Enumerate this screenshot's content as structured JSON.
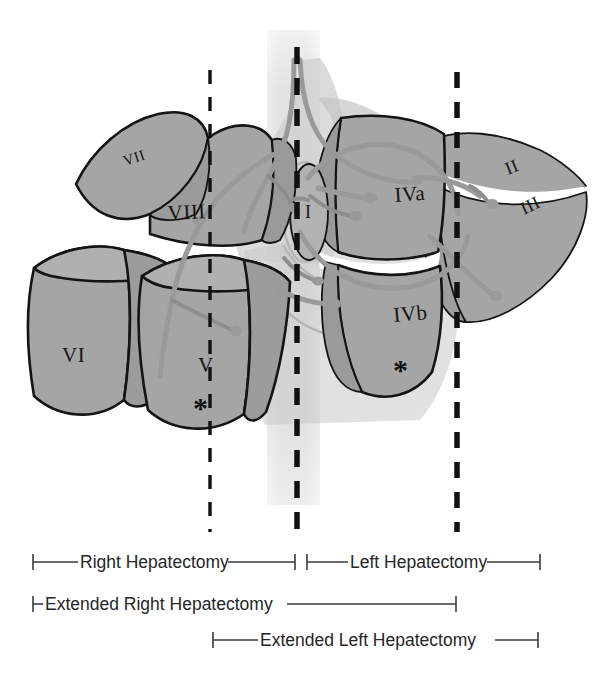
{
  "figure": {
    "background_color": "#ffffff"
  },
  "colors": {
    "segment_fill": "#a5a5a5",
    "segment_fill_light": "#b9b9b9",
    "segment_outline": "#141414",
    "vena_cava": "#e2e2e2",
    "vessel": "#9a9a9a",
    "division_line": "#111111",
    "bracket": "#3a3a3a",
    "label_text": "#151515"
  },
  "segments": [
    {
      "id": "II",
      "label": "II",
      "x": 508,
      "y": 175,
      "size": "md",
      "rotate": -22
    },
    {
      "id": "III",
      "label": "III",
      "x": 524,
      "y": 215,
      "size": "md",
      "rotate": -26
    },
    {
      "id": "IVa",
      "label": "IVa",
      "x": 395,
      "y": 202,
      "size": "lg",
      "rotate": -4
    },
    {
      "id": "IVb",
      "label": "IVb",
      "x": 394,
      "y": 322,
      "size": "lg",
      "rotate": -5
    },
    {
      "id": "I",
      "label": "I",
      "x": 311,
      "y": 210,
      "size": "md",
      "rotate": 0
    },
    {
      "id": "V",
      "label": "V",
      "x": 198,
      "y": 362,
      "size": "xl",
      "rotate": 0
    },
    {
      "id": "VI",
      "label": "VI",
      "x": 83,
      "y": 355,
      "size": "xl",
      "rotate": 0
    },
    {
      "id": "VII",
      "label": "VII",
      "x": 131,
      "y": 160,
      "size": "sm",
      "rotate": -18
    },
    {
      "id": "VIII",
      "label": "VIII",
      "x": 186,
      "y": 212,
      "size": "lg",
      "rotate": -3
    }
  ],
  "asterisks": [
    {
      "id": "asterisk-segment-v",
      "label": "*",
      "x": 201,
      "y": 410
    },
    {
      "id": "asterisk-segment-ivb",
      "label": "*",
      "x": 401,
      "y": 372
    }
  ],
  "division_lines": [
    {
      "id": "right-plane",
      "x": 210,
      "y1": 70,
      "y2": 532
    },
    {
      "id": "middle-plane",
      "x": 297,
      "y1": 47,
      "y2": 532
    },
    {
      "id": "left-plane",
      "x": 457,
      "y1": 72,
      "y2": 532
    }
  ],
  "resection_brackets": [
    {
      "id": "right-hepatectomy",
      "label": "Right Hepatectomy",
      "x_start": 32,
      "x_end": 296,
      "y": 562,
      "text_x": 164
    },
    {
      "id": "left-hepatectomy",
      "label": "Left Hepatectomy",
      "x_start": 306,
      "x_end": 540,
      "y": 562,
      "text_x": 423
    },
    {
      "id": "extended-right-hepatectomy",
      "label": "Extended Right Hepatectomy",
      "x_start": 32,
      "x_end": 456,
      "y": 604,
      "text_x": 178
    },
    {
      "id": "extended-left-hepatectomy",
      "label": "Extended Left Hepatectomy",
      "x_start": 212,
      "x_end": 538,
      "y": 640,
      "text_x": 400
    }
  ]
}
